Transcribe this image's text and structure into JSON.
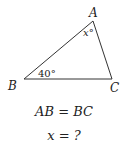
{
  "diagram": {
    "vertices": {
      "A": {
        "label": "A",
        "x": 93,
        "y": 21
      },
      "B": {
        "label": "B",
        "x": 24,
        "y": 79
      },
      "C": {
        "label": "C",
        "x": 112,
        "y": 79
      }
    },
    "angle_labels": {
      "at_A": "x°",
      "at_B": "40°"
    },
    "line_color": "#333333"
  },
  "equations": {
    "line1": "AB = BC",
    "line2": "x = ?"
  }
}
